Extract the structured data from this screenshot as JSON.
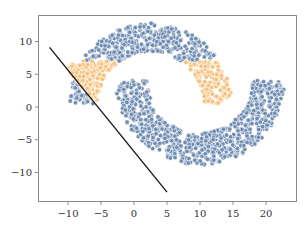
{
  "chart_data": {
    "type": "scatter",
    "title": "",
    "xlabel": "",
    "ylabel": "",
    "xlim": [
      -14.5,
      24.5
    ],
    "ylim": [
      -14.5,
      14
    ],
    "grid": false,
    "legend": null,
    "x_ticks": [
      -10,
      -5,
      0,
      5,
      10,
      15,
      20
    ],
    "x_tick_labels": [
      "−10",
      "−5",
      "0",
      "5",
      "10",
      "15",
      "20"
    ],
    "y_ticks": [
      10,
      5,
      0,
      -5,
      -10
    ],
    "y_tick_labels": [
      "10",
      "5",
      "0",
      "−5",
      "−10"
    ],
    "series": [
      {
        "name": "upper moon (class blue)",
        "color": "#6f8db3",
        "shape": "half-ring",
        "center": [
          2.5,
          0.5
        ],
        "radius_inner": 8.0,
        "radius_outer": 12.3,
        "angle_start_deg": 0,
        "angle_end_deg": 180,
        "approx_points": 700
      },
      {
        "name": "lower moon (class blue)",
        "color": "#6f8db3",
        "shape": "half-ring",
        "center": [
          10.0,
          4.0
        ],
        "radius_inner": 8.0,
        "radius_outer": 12.8,
        "angle_start_deg": 180,
        "angle_end_deg": 360,
        "approx_points": 750
      },
      {
        "name": "misclassified region (class orange)",
        "color": "#f4c27e",
        "shape": "left-of-boundary subset of upper moon tip",
        "x_range": [
          -12.5,
          -6.5
        ],
        "y_range": [
          0,
          6.5
        ],
        "approx_points": 90
      }
    ],
    "decision_boundary": {
      "type": "line",
      "color": "#1a1a1a",
      "from": [
        -12.8,
        9.1
      ],
      "to": [
        5.0,
        -13.0
      ]
    }
  }
}
